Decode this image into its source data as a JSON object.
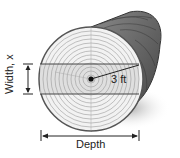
{
  "figure": {
    "labels": {
      "width": "Width, x",
      "radius": "3 ft",
      "depth": "Depth"
    },
    "colors": {
      "wood_face": "#f2f2f2",
      "rings": "#9a9a9a",
      "bark": "#6a6a6a",
      "band_shade": "#d8d8d8",
      "shadow": "#bdbdbd",
      "ink": "#222222"
    }
  }
}
